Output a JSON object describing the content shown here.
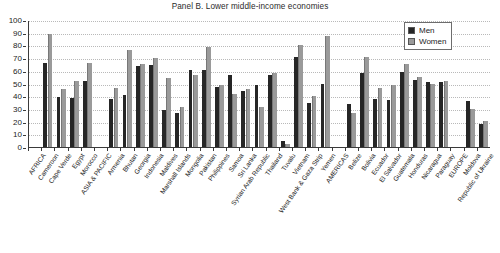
{
  "chart_data": {
    "type": "bar",
    "title": "Panel B. Lower middle-income economies",
    "xlabel": "",
    "ylabel": "",
    "ylim": [
      0,
      100
    ],
    "ytick_step": 10,
    "yticks": [
      0,
      10,
      20,
      30,
      40,
      50,
      60,
      70,
      80,
      90,
      100
    ],
    "grid": true,
    "legend_position": "top-right",
    "legend": [
      "Men",
      "Women"
    ],
    "colors": {
      "men": "#262626",
      "women": "#9a9a9a",
      "axis": "#3a3a3a",
      "grid": "#b9b9b9",
      "background": "#ffffff"
    },
    "categories": [
      "AFRICA",
      "Cameroon",
      "Cape Verde",
      "Egypt",
      "Morocco",
      "ASIA & PACIFIC",
      "Armenia",
      "Bhutan",
      "Georgia",
      "Indonesia",
      "Maldives",
      "Marshall Islands",
      "Mongolia",
      "Pakistan",
      "Philippines",
      "Samoa",
      "Sri Lanka",
      "Syrian Arab Republic",
      "Thailand",
      "Tuvalu",
      "Vietnam",
      "West Bank & Gaza Strip",
      "Yemen",
      "AMERICAS",
      "Belize",
      "Bolivia",
      "Ecuador",
      "El Salvador",
      "Guatemala",
      "Honduras",
      "Nicaragua",
      "Paraguay",
      "EUROPE",
      "Moldova",
      "Republic of Ukraine"
    ],
    "series": [
      {
        "name": "Men",
        "values": [
          null,
          66.5,
          39.0,
          38.8,
          52.0,
          null,
          38.2,
          41.0,
          63.5,
          64.5,
          29.5,
          26.5,
          60.5,
          61.0,
          47.5,
          56.5,
          43.8,
          49.0,
          57.0,
          4.5,
          71.0,
          34.3,
          50.0,
          null,
          34.0,
          58.0,
          38.0,
          37.2,
          59.3,
          52.8,
          51.2,
          50.8,
          null,
          36.5,
          18.5
        ]
      },
      {
        "name": "Women",
        "values": [
          null,
          89.0,
          45.3,
          51.8,
          66.3,
          null,
          46.8,
          76.5,
          65.7,
          69.7,
          54.5,
          31.3,
          56.8,
          78.5,
          49.0,
          41.5,
          46.0,
          31.5,
          58.2,
          2.0,
          80.0,
          40.2,
          87.5,
          null,
          27.0,
          71.0,
          46.8,
          48.8,
          65.3,
          55.3,
          49.3,
          51.8,
          null,
          30.3,
          20.5
        ]
      }
    ]
  }
}
